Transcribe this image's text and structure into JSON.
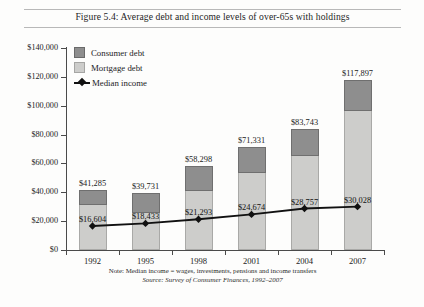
{
  "figure": {
    "title": "Figure 5.4: Average debt and income levels of over-65s with holdings",
    "note": "Note: Median income = wages, investments, pensions and income transfers",
    "source": "Source: Survey of Consumer Finances, 1992–2007"
  },
  "legend": {
    "position": "inside-top-left",
    "items": [
      {
        "label": "Consumer debt",
        "marker": "square-swatch",
        "color": "#8e8e8e"
      },
      {
        "label": "Mortgage debt",
        "marker": "square-swatch",
        "color": "#cdcdcb"
      },
      {
        "label": "Median income",
        "marker": "line-with-diamond-marker",
        "color": "#111111"
      }
    ]
  },
  "axes": {
    "y_labels": [
      "$140,000",
      "$120,000",
      "$100,000",
      "$80,000",
      "$60,000",
      "$40,000",
      "$20,000",
      "$0"
    ],
    "x_labels": [
      "1992",
      "1995",
      "1998",
      "2001",
      "2004",
      "2007"
    ]
  },
  "chart_data": {
    "type": "bar",
    "title": "Figure 5.4: Average debt and income levels of over-65s with holdings",
    "xlabel": "",
    "ylabel": "",
    "ylim": [
      0,
      140000
    ],
    "ytick_step": 20000,
    "grid": false,
    "stacked": true,
    "legend_position": "inside-top-left",
    "categories": [
      "1992",
      "1995",
      "1998",
      "2001",
      "2004",
      "2007"
    ],
    "series": [
      {
        "name": "Mortgage debt",
        "type": "bar",
        "color": "#cdcdcb",
        "values": [
          30964,
          25825,
          40809,
          53498,
          65320,
          96675
        ]
      },
      {
        "name": "Consumer debt",
        "type": "bar",
        "color": "#8e8e8e",
        "values": [
          10321,
          13906,
          17489,
          17833,
          18423,
          21222
        ]
      },
      {
        "name": "Median income",
        "type": "line",
        "color": "#111111",
        "values": [
          16604,
          18433,
          21293,
          24674,
          28757,
          30028
        ],
        "labels": [
          "$16,604",
          "$18,433",
          "$21,293",
          "$24,674",
          "$28,757",
          "$30,028"
        ]
      }
    ],
    "bar_totals": [
      41285,
      39731,
      58298,
      71331,
      83743,
      117897
    ],
    "bar_total_labels": [
      "$41,285",
      "$39,731",
      "$58,298",
      "$71,331",
      "$83,743",
      "$117,897"
    ],
    "annotations": [
      "Note: Median income = wages, investments, pensions and income transfers",
      "Source: Survey of Consumer Finances, 1992–2007"
    ]
  }
}
